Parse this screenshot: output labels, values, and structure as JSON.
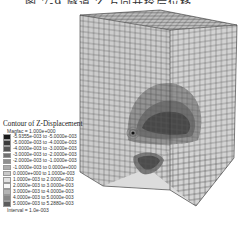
{
  "title": {
    "text": "图 7-9  隧道 Z 方向开挖后位移",
    "cropped": true
  },
  "legend": {
    "title": "Contour of Z-Displacement",
    "magfac": "Magfac =  1.000e+000",
    "interval": "Interval =  1.0e-003",
    "items": [
      {
        "label": "-5.9355e-003 to -5.0000e-003",
        "color": "#1a1a1a"
      },
      {
        "label": "-5.0000e-003 to -4.0000e-003",
        "color": "#3a3a3a"
      },
      {
        "label": "-4.0000e-003 to -3.0000e-003",
        "color": "#555555"
      },
      {
        "label": "-3.0000e-003 to -2.0000e-003",
        "color": "#717171"
      },
      {
        "label": "-2.0000e-003 to -1.0000e-003",
        "color": "#8e8e8e"
      },
      {
        "label": "-1.0000e-003 to  0.0000e+000",
        "color": "#ababab"
      },
      {
        "label": " 0.0000e+000 to  1.0000e-003",
        "color": "#c9c9c9"
      },
      {
        "label": " 1.0000e-003 to  2.0000e-003",
        "color": "#e2e2e2"
      },
      {
        "label": " 2.0000e-003 to  3.0000e-003",
        "color": "#f7f7f7"
      },
      {
        "label": " 3.0000e-003 to  4.0000e-003",
        "color": "#b5b5b5"
      },
      {
        "label": " 4.0000e-003 to  5.0000e-003",
        "color": "#888888"
      },
      {
        "label": " 5.0000e-003 to  5.2880e-003",
        "color": "#5c5c5c"
      }
    ]
  },
  "model": {
    "description": "3D meshed block with tunnel excavation, Z-displacement contours",
    "face_color": "#c8c8c8",
    "top_color": "#b9b9b9",
    "mesh_color": "#555555",
    "contour_dark": "#4a4a4a",
    "contour_mid": "#7d7d7d"
  }
}
